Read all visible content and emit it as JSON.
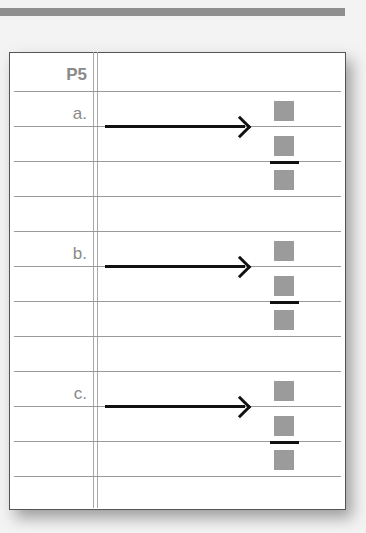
{
  "header": {
    "title": "P5"
  },
  "problems": [
    {
      "label": "a.",
      "answer_boxes": [
        "",
        "",
        ""
      ]
    },
    {
      "label": "b.",
      "answer_boxes": [
        "",
        "",
        ""
      ]
    },
    {
      "label": "c.",
      "answer_boxes": [
        "",
        "",
        ""
      ]
    }
  ],
  "colors": {
    "top_bar": "#8f8f8f",
    "rule_lines": "#9a9a9a",
    "label_text": "#8a8a8a",
    "answer_box": "#9b9b9b",
    "arrow": "#111111"
  }
}
